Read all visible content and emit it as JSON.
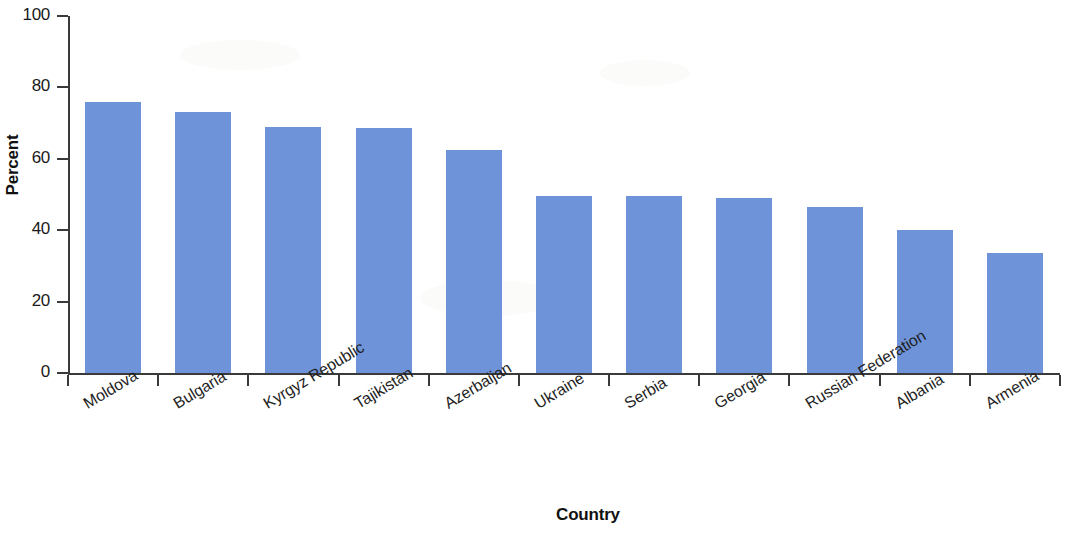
{
  "chart_data": {
    "type": "bar",
    "title": "",
    "xlabel": "Country",
    "ylabel": "Percent",
    "categories": [
      "Moldova",
      "Bulgaria",
      "Kyrgyz Republic",
      "Tajikistan",
      "Azerbaijan",
      "Ukraine",
      "Serbia",
      "Georgia",
      "Russian Federation",
      "Albania",
      "Armenia"
    ],
    "values": [
      76,
      73,
      69,
      68.5,
      62.5,
      49.5,
      49.5,
      49,
      46.5,
      40,
      33.5
    ],
    "ylim": [
      0,
      100
    ],
    "yticks": [
      0,
      20,
      40,
      60,
      80,
      100
    ],
    "ytick_labels": [
      "0",
      "20",
      "40",
      "60",
      "80",
      "100"
    ],
    "grid": false,
    "legend": false,
    "bar_color": "#6e93d8",
    "axis_color": "#3a3a3a"
  }
}
